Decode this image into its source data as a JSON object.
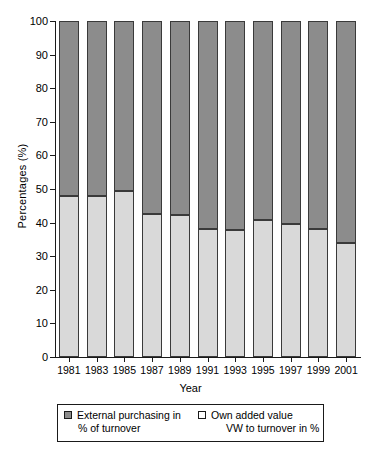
{
  "chart_data": {
    "type": "bar",
    "stacked": true,
    "title": "",
    "xlabel": "Year",
    "ylabel": "Percentages (%)",
    "categories": [
      "1981",
      "1983",
      "1985",
      "1987",
      "1989",
      "1991",
      "1993",
      "1995",
      "1997",
      "1999",
      "2001"
    ],
    "ylim": [
      0,
      100
    ],
    "yticks": [
      0,
      10,
      20,
      30,
      40,
      50,
      60,
      70,
      80,
      90,
      100
    ],
    "ytick_labels": [
      "0",
      "10",
      "20",
      "30",
      "40",
      "50",
      "60",
      "70",
      "80",
      "90",
      "100"
    ],
    "grid": false,
    "legend_position": "below-axes",
    "series": [
      {
        "name": "Own added value VW to turnover in %",
        "legend_line1": "Own added value",
        "legend_line2": "VW to turnover in %",
        "color": "#d9d9d9",
        "swatch": "light-square",
        "values": [
          48.0,
          48.0,
          49.3,
          42.5,
          42.3,
          38.2,
          37.7,
          40.7,
          39.5,
          38.2,
          34.0
        ]
      },
      {
        "name": "External purchasing in % of turnover",
        "legend_line1": "External purchasing in",
        "legend_line2": "% of turnover",
        "color": "#8c8c8c",
        "swatch": "dark-square",
        "values": [
          52.0,
          52.0,
          50.7,
          57.5,
          57.7,
          61.8,
          62.3,
          59.3,
          60.5,
          61.8,
          66.0
        ]
      }
    ]
  },
  "colors": {
    "dark_segment": "#8c8c8c",
    "light_segment": "#d9d9d9",
    "axis": "#1a1a1a",
    "background": "#ffffff"
  }
}
